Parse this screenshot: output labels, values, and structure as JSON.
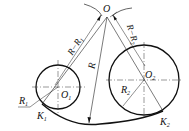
{
  "figure": {
    "type": "geometric-construction",
    "labels": {
      "O": "O",
      "O1": "O",
      "O1_sub": "1",
      "O2": "O",
      "O2_sub": "2",
      "R": "R",
      "R1": "R",
      "R1_sub": "1",
      "R2": "R",
      "R2_sub": "2",
      "K1": "K",
      "K1_sub": "1",
      "K2": "K",
      "K2_sub": "2",
      "R_minus_R1": "R−R",
      "R_minus_R1_sub": "1",
      "R_minus_R2": "R−R",
      "R_minus_R2_sub": "2"
    },
    "colors": {
      "stroke": "#111111",
      "background": "#ffffff"
    }
  }
}
